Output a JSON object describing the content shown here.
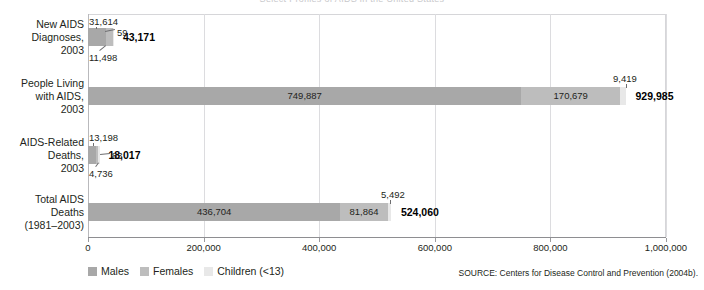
{
  "figure": {
    "clipped_title": "Select Profiles of AIDS in the United States",
    "source_note": "SOURCE: Centers for Disease Control and Prevention (2004b)."
  },
  "legend": {
    "items": [
      {
        "label": "Males",
        "color": "#a8a8a8"
      },
      {
        "label": "Females",
        "color": "#bdbdbd"
      },
      {
        "label": "Children (<13)",
        "color": "#e8e8e8"
      }
    ]
  },
  "axis": {
    "min": 0,
    "max": 1000000,
    "tick_labels": [
      "0",
      "200,000",
      "400,000",
      "600,000",
      "800,000",
      "1,000,000"
    ],
    "tick_values": [
      0,
      200000,
      400000,
      600000,
      800000,
      1000000
    ]
  },
  "chart_data": {
    "type": "bar",
    "orientation": "horizontal",
    "stacked": true,
    "title": "Select Profiles of AIDS in the United States",
    "xlabel": "",
    "ylabel": "",
    "xlim": [
      0,
      1000000
    ],
    "grid": true,
    "legend_position": "bottom-left",
    "categories": [
      "New AIDS Diagnoses, 2003",
      "People Living with AIDS, 2003",
      "AIDS-Related Deaths, 2003",
      "Total AIDS Deaths (1981–2003)"
    ],
    "category_lines": [
      [
        "New AIDS",
        "Diagnoses,",
        "2003"
      ],
      [
        "People Living",
        "with AIDS,",
        "2003"
      ],
      [
        "AIDS-Related",
        "Deaths,",
        "2003"
      ],
      [
        "Total AIDS",
        "Deaths",
        "(1981–2003)"
      ]
    ],
    "series": [
      {
        "name": "Males",
        "values": [
          31614,
          749887,
          13198,
          436704
        ]
      },
      {
        "name": "Females",
        "values": [
          11498,
          170679,
          4736,
          81864
        ]
      },
      {
        "name": "Children (<13)",
        "values": [
          59,
          9419,
          83,
          5492
        ]
      }
    ],
    "totals": [
      43171,
      929985,
      18017,
      524060
    ],
    "value_labels": {
      "males": [
        "31,614",
        "749,887",
        "13,198",
        "436,704"
      ],
      "females": [
        "11,498",
        "170,679",
        "4,736",
        "81,864"
      ],
      "children": [
        "59",
        "9,419",
        "83",
        "5,492"
      ],
      "totals": [
        "43,171",
        "929,985",
        "18,017",
        "524,060"
      ]
    }
  }
}
